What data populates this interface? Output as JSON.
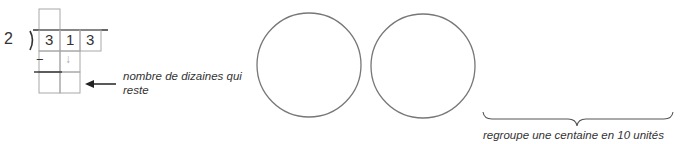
{
  "division": {
    "divisor": "2",
    "dividend_digits": [
      "3",
      "1",
      "3"
    ],
    "minus_sign": "−",
    "bring_down_arrow": "↓"
  },
  "annotations": {
    "remaining_tens_label": "nombre de dizaines qui reste",
    "regroup_label": "regroupe une centaine en 10 unités"
  },
  "circles": [
    {
      "cx": 309,
      "cy": 65,
      "r": 52
    },
    {
      "cx": 423,
      "cy": 66,
      "r": 52
    }
  ],
  "colors": {
    "grid": "#a8a8a8",
    "ink": "#333333",
    "circle": "#777777",
    "arrow_down": "#aaaaaa"
  }
}
